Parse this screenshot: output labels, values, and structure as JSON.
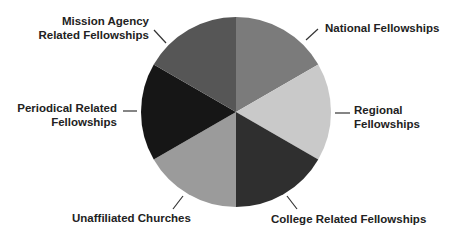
{
  "chart_data": {
    "type": "pie",
    "title": "",
    "categories": [
      "National Fellowships",
      "Regional Fellowships",
      "College Related Fellowships",
      "Unaffiliated Churches",
      "Periodical Related Fellowships",
      "Mission Agency Related Fellowships"
    ],
    "values": [
      1,
      1,
      1,
      1,
      1,
      1
    ],
    "colors": [
      "#7b7b7b",
      "#c9c9c9",
      "#2f2f2f",
      "#9b9b9b",
      "#161616",
      "#565656"
    ],
    "start_angle_deg": 0,
    "direction": "clockwise",
    "legend": "none (leader-line labels around pie)"
  },
  "labels": {
    "national": [
      "National Fellowships"
    ],
    "regional": [
      "Regional",
      "Fellowships"
    ],
    "college": [
      "College Related Fellowships"
    ],
    "unaffiliated": [
      "Unaffiliated Churches"
    ],
    "periodical": [
      "Periodical Related",
      "Fellowships"
    ],
    "mission": [
      "Mission Agency",
      "Related Fellowships"
    ]
  }
}
